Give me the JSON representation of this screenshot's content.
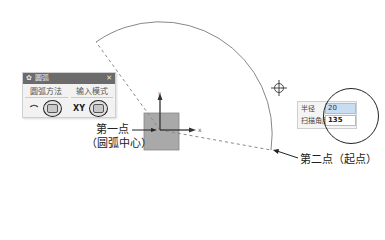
{
  "dialog": {
    "title": "圆弧",
    "close_glyph": "✕",
    "gear_glyph": "✿",
    "method_label": "圆弧方法",
    "method_option_glyph": "⌒",
    "input_label": "输入模式",
    "input_option_text": "XY"
  },
  "input_panel": {
    "radius_label": "半径",
    "radius_value": "20",
    "sweep_label": "扫描角度",
    "sweep_value": "135"
  },
  "annotations": {
    "first_point_line1": "第一点",
    "first_point_line2": "（圆弧中心）",
    "second_point": "第二点（起点）"
  },
  "axes": {
    "x_label": "x",
    "y_label": "y"
  },
  "arc": {
    "radius": 20,
    "sweep_deg": 135
  }
}
